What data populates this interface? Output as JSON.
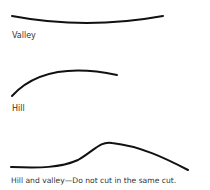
{
  "figures": [
    {
      "id": "valley",
      "label": "Valley"
    },
    {
      "id": "hill",
      "label": "Hill"
    },
    {
      "id": "hill-and-valley",
      "label": "Hill and valley—Do not cut in the same cut."
    }
  ],
  "colors": {
    "line": "#111111",
    "text": "#333333",
    "background": "#ffffff"
  }
}
